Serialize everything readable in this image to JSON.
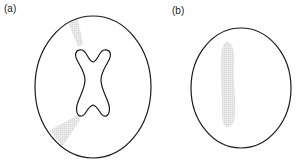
{
  "panels": [
    {
      "label": "(a)",
      "outline": "ellipse",
      "inner_shape": "x-shaped / dog-bone contour",
      "shaded_regions": [
        "upper-left wedge",
        "lower-left wedge"
      ]
    },
    {
      "label": "(b)",
      "outline": "ellipse",
      "inner_shape": "none",
      "shaded_regions": [
        "vertical band left of center"
      ]
    }
  ],
  "colors": {
    "stroke": "#1a1a1a",
    "shade": "#d9d9d9",
    "background": "#ffffff"
  }
}
